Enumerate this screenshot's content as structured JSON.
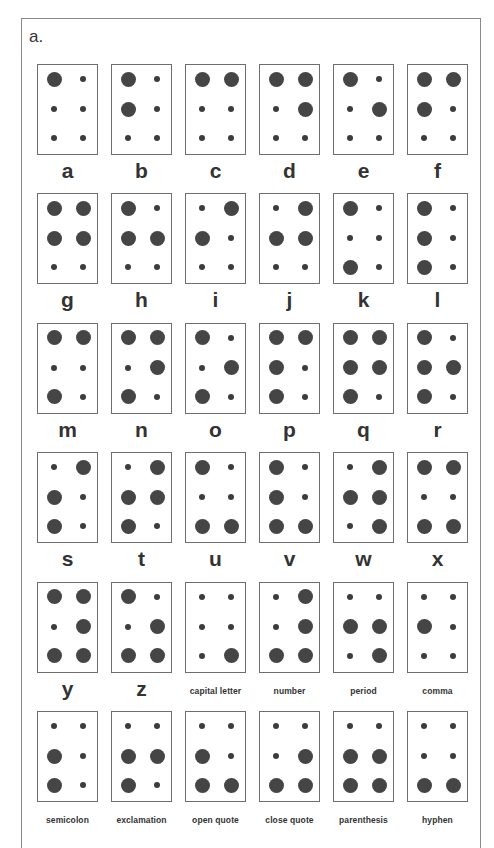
{
  "panel_label": "a.",
  "layout": {
    "columns": 6,
    "rows": 6,
    "col_pitch": 74,
    "row_pitch": 129.4
  },
  "colors": {
    "raised_dot": "#454545",
    "flat_dot": "#3c3c3c",
    "border": "#6e6e6e",
    "label": "#333333"
  },
  "dot_numbering": "dots 1-2-3 left column top-to-bottom, dots 4-5-6 right column top-to-bottom",
  "cells": [
    {
      "label": "a",
      "type": "letter",
      "dots": [
        1
      ]
    },
    {
      "label": "b",
      "type": "letter",
      "dots": [
        1,
        2
      ]
    },
    {
      "label": "c",
      "type": "letter",
      "dots": [
        1,
        4
      ]
    },
    {
      "label": "d",
      "type": "letter",
      "dots": [
        1,
        4,
        5
      ]
    },
    {
      "label": "e",
      "type": "letter",
      "dots": [
        1,
        5
      ]
    },
    {
      "label": "f",
      "type": "letter",
      "dots": [
        1,
        2,
        4
      ]
    },
    {
      "label": "g",
      "type": "letter",
      "dots": [
        1,
        2,
        4,
        5
      ]
    },
    {
      "label": "h",
      "type": "letter",
      "dots": [
        1,
        2,
        5
      ]
    },
    {
      "label": "i",
      "type": "letter",
      "dots": [
        2,
        4
      ]
    },
    {
      "label": "j",
      "type": "letter",
      "dots": [
        2,
        4,
        5
      ]
    },
    {
      "label": "k",
      "type": "letter",
      "dots": [
        1,
        3
      ]
    },
    {
      "label": "l",
      "type": "letter",
      "dots": [
        1,
        2,
        3
      ]
    },
    {
      "label": "m",
      "type": "letter",
      "dots": [
        1,
        3,
        4
      ]
    },
    {
      "label": "n",
      "type": "letter",
      "dots": [
        1,
        3,
        4,
        5
      ]
    },
    {
      "label": "o",
      "type": "letter",
      "dots": [
        1,
        3,
        5
      ]
    },
    {
      "label": "p",
      "type": "letter",
      "dots": [
        1,
        2,
        3,
        4
      ]
    },
    {
      "label": "q",
      "type": "letter",
      "dots": [
        1,
        2,
        3,
        4,
        5
      ]
    },
    {
      "label": "r",
      "type": "letter",
      "dots": [
        1,
        2,
        3,
        5
      ]
    },
    {
      "label": "s",
      "type": "letter",
      "dots": [
        2,
        3,
        4
      ]
    },
    {
      "label": "t",
      "type": "letter",
      "dots": [
        2,
        3,
        4,
        5
      ]
    },
    {
      "label": "u",
      "type": "letter",
      "dots": [
        1,
        3,
        6
      ]
    },
    {
      "label": "v",
      "type": "letter",
      "dots": [
        1,
        2,
        3,
        6
      ]
    },
    {
      "label": "w",
      "type": "letter",
      "dots": [
        2,
        4,
        5,
        6
      ]
    },
    {
      "label": "x",
      "type": "letter",
      "dots": [
        1,
        3,
        4,
        6
      ]
    },
    {
      "label": "y",
      "type": "letter",
      "dots": [
        1,
        3,
        4,
        5,
        6
      ]
    },
    {
      "label": "z",
      "type": "letter",
      "dots": [
        1,
        3,
        5,
        6
      ]
    },
    {
      "label": "capital letter",
      "type": "word",
      "dots": [
        6
      ]
    },
    {
      "label": "number",
      "type": "word",
      "dots": [
        3,
        4,
        5,
        6
      ]
    },
    {
      "label": "period",
      "type": "word",
      "dots": [
        2,
        5,
        6
      ]
    },
    {
      "label": "comma",
      "type": "word",
      "dots": [
        2
      ]
    },
    {
      "label": "semicolon",
      "type": "word",
      "dots": [
        2,
        3
      ]
    },
    {
      "label": "exclamation",
      "type": "word",
      "dots": [
        2,
        3,
        5
      ]
    },
    {
      "label": "open quote",
      "type": "word",
      "dots": [
        2,
        3,
        6
      ]
    },
    {
      "label": "close quote",
      "type": "word",
      "dots": [
        3,
        5,
        6
      ]
    },
    {
      "label": "parenthesis",
      "type": "word",
      "dots": [
        2,
        3,
        5,
        6
      ]
    },
    {
      "label": "hyphen",
      "type": "word",
      "dots": [
        3,
        6
      ]
    }
  ]
}
